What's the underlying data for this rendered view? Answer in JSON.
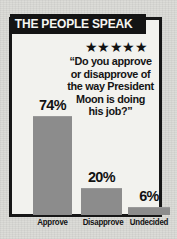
{
  "banner": {
    "title": "THE PEOPLE SPEAK"
  },
  "stars": {
    "glyphs": "★★★★★",
    "count": 5
  },
  "question": {
    "line1": "“Do you approve",
    "line2": "or disapprove of",
    "line3": "the way President",
    "line4": "Moon is doing",
    "line5": "his job?”"
  },
  "colors": {
    "bar": "#8c8c8c",
    "frame": "#171717",
    "banner_bg": "#141414",
    "banner_text": "#f6f6f2",
    "paper": "#dcdcd8",
    "panel": "#f2f2ee"
  },
  "chart_data": {
    "type": "bar",
    "title": "THE PEOPLE SPEAK",
    "categories": [
      "Approve",
      "Disapprove",
      "Undecided"
    ],
    "values": [
      74,
      20,
      6
    ],
    "value_labels": [
      "74%",
      "20%",
      "6%"
    ],
    "xlabel": "",
    "ylabel": "",
    "ylim": [
      0,
      100
    ],
    "grid": false,
    "legend": "none",
    "units": "percent"
  }
}
